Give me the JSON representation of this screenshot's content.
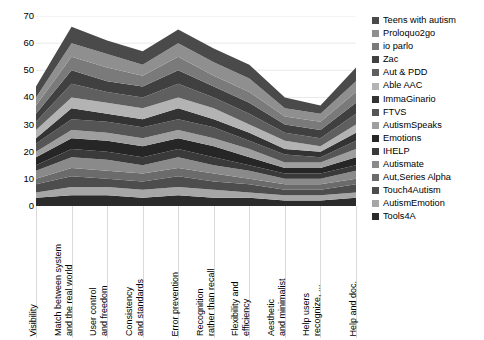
{
  "chart_data": {
    "type": "area",
    "stacked": true,
    "title": "",
    "xlabel": "",
    "ylabel": "",
    "ylim": [
      0,
      70
    ],
    "ytick_labels": [
      "70",
      "60",
      "50",
      "40",
      "30",
      "20",
      "10",
      "0"
    ],
    "ytick_values": [
      70,
      60,
      50,
      40,
      30,
      20,
      10,
      0
    ],
    "grid": true,
    "legend_position": "right",
    "categories": [
      "Visibility",
      "Match between system and the real world",
      "User control and freedom",
      "Consistency and standards",
      "Error prevention",
      "Recognition rather than recall",
      "Flexibility and efficiency",
      "Aesthetic and minimalist",
      "Help users recognize, ...",
      "Help and doc."
    ],
    "category_lines": [
      [
        "Visibility"
      ],
      [
        "Match between system",
        "and the real world"
      ],
      [
        "User control",
        "and freedom"
      ],
      [
        "Consistency",
        "and standards"
      ],
      [
        "Error prevention"
      ],
      [
        "Recognition",
        "rather than recall"
      ],
      [
        "Flexibility and",
        "efficiency"
      ],
      [
        "Aesthetic",
        "and minimalist"
      ],
      [
        "Help users",
        "recognize, ..."
      ],
      [
        "Help and doc."
      ]
    ],
    "series": [
      {
        "name": "Tools4A",
        "color": "#2b2b2b",
        "values": [
          3,
          4,
          4,
          3,
          4,
          3,
          3,
          2,
          2,
          3
        ]
      },
      {
        "name": "AutismEmotion",
        "color": "#a6a6a6",
        "values": [
          2,
          3,
          3,
          3,
          3,
          3,
          2,
          2,
          2,
          2
        ]
      },
      {
        "name": "Touch4Autism",
        "color": "#4d4d4d",
        "values": [
          3,
          4,
          3,
          3,
          4,
          3,
          3,
          2,
          2,
          3
        ]
      },
      {
        "name": "Aut,Series Alpha",
        "color": "#6b6b6b",
        "values": [
          2,
          3,
          3,
          3,
          3,
          3,
          2,
          2,
          2,
          2
        ]
      },
      {
        "name": "Autismate",
        "color": "#8a8a8a",
        "values": [
          3,
          4,
          4,
          3,
          4,
          3,
          3,
          2,
          2,
          3
        ]
      },
      {
        "name": "IHELP",
        "color": "#3a3a3a",
        "values": [
          2,
          3,
          3,
          3,
          3,
          3,
          2,
          2,
          2,
          2
        ]
      },
      {
        "name": "Emotions",
        "color": "#262626",
        "values": [
          3,
          4,
          4,
          4,
          4,
          4,
          3,
          2,
          2,
          3
        ]
      },
      {
        "name": "AutismSpeaks",
        "color": "#9e9e9e",
        "values": [
          2,
          3,
          3,
          3,
          3,
          3,
          3,
          2,
          2,
          3
        ]
      },
      {
        "name": "FTVS",
        "color": "#555555",
        "values": [
          3,
          4,
          4,
          4,
          4,
          4,
          3,
          3,
          2,
          3
        ]
      },
      {
        "name": "ImmaGinario",
        "color": "#333333",
        "values": [
          2,
          4,
          3,
          3,
          4,
          3,
          3,
          2,
          2,
          3
        ]
      },
      {
        "name": "Able AAC",
        "color": "#b3b3b3",
        "values": [
          3,
          4,
          4,
          4,
          4,
          4,
          3,
          3,
          2,
          3
        ]
      },
      {
        "name": "Aut & PDD",
        "color": "#5f5f5f",
        "values": [
          3,
          5,
          4,
          4,
          5,
          4,
          4,
          3,
          3,
          4
        ]
      },
      {
        "name": "Zac",
        "color": "#404040",
        "values": [
          3,
          5,
          4,
          4,
          5,
          4,
          4,
          3,
          3,
          4
        ]
      },
      {
        "name": "io parlo",
        "color": "#7a7a7a",
        "values": [
          3,
          5,
          5,
          4,
          5,
          4,
          4,
          3,
          3,
          4
        ]
      },
      {
        "name": "Proloquo2go",
        "color": "#8f8f8f",
        "values": [
          3,
          5,
          5,
          4,
          5,
          5,
          5,
          3,
          3,
          4
        ]
      },
      {
        "name": "Teens with autism",
        "color": "#4a4a4a",
        "values": [
          4,
          6,
          5,
          5,
          5,
          5,
          5,
          4,
          3,
          5
        ]
      }
    ],
    "legend_order": [
      "Teens with autism",
      "Proloquo2go",
      "io parlo",
      "Zac",
      "Aut & PDD",
      "Able AAC",
      "ImmaGinario",
      "FTVS",
      "AutismSpeaks",
      "Emotions",
      "IHELP",
      "Autismate",
      "Aut,Series Alpha",
      "Touch4Autism",
      "AutismEmotion",
      "Tools4A"
    ],
    "stack_totals": [
      41,
      62,
      58,
      55,
      62,
      56,
      51,
      39,
      35,
      49
    ]
  }
}
